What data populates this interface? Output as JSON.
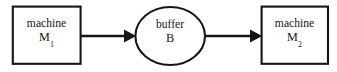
{
  "diagram": {
    "background_color": "#ffffff",
    "stroke_color": "#161616",
    "nodes": [
      {
        "id": "machine-1",
        "shape": "rectangle",
        "label_line1": "machine",
        "label_line2_base": "M",
        "label_line2_subscript": "1",
        "label_full": "machine M1"
      },
      {
        "id": "buffer",
        "shape": "ellipse",
        "label_line1": "buffer",
        "label_line2_base": "B",
        "label_line2_subscript": "",
        "label_full": "buffer B"
      },
      {
        "id": "machine-2",
        "shape": "rectangle",
        "label_line1": "machine",
        "label_line2_base": "M",
        "label_line2_subscript": "2",
        "label_full": "machine M2"
      }
    ],
    "edges": [
      {
        "id": "edge-machine1-to-buffer",
        "from": "machine-1",
        "to": "buffer",
        "label": "",
        "arrowhead": "filled-triangle",
        "direction": "left-to-right"
      },
      {
        "id": "edge-buffer-to-machine2",
        "from": "buffer",
        "to": "machine-2",
        "label": "",
        "arrowhead": "filled-triangle",
        "direction": "left-to-right"
      }
    ]
  }
}
